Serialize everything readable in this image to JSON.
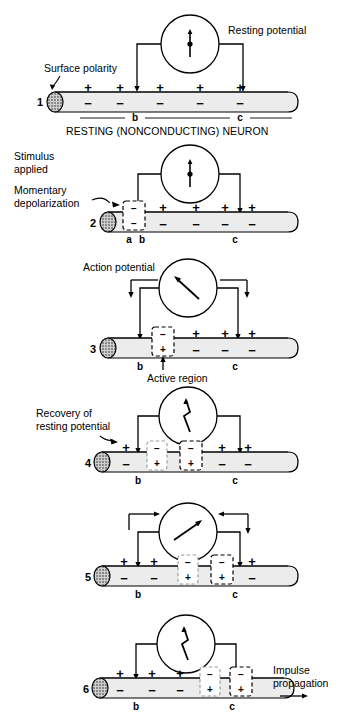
{
  "figure": {
    "title_caption": "RESTING (NONCONDUCTING) NEURON"
  },
  "panels": [
    {
      "number": "1",
      "callouts": [
        {
          "name": "surface-polarity",
          "text": "Surface polarity"
        },
        {
          "name": "resting-potential",
          "text": "Resting potential"
        }
      ],
      "caption": "RESTING (NONCONDUCTING) NEURON",
      "electrode_labels": [
        "b",
        "c"
      ],
      "top_charges": [
        "+",
        "+",
        "+",
        "+",
        "+"
      ],
      "bottom_charges": [
        "−",
        "−",
        "−",
        "−",
        "−"
      ],
      "meter_needle": "vertical",
      "active_boxes": []
    },
    {
      "number": "2",
      "callouts": [
        {
          "name": "stimulus-applied",
          "text": "Stimulus\napplied"
        },
        {
          "name": "momentary-depolarization",
          "text": "Momentary\ndepolarization"
        }
      ],
      "caption": "",
      "electrode_labels": [
        "a",
        "b",
        "c"
      ],
      "top_charges": [
        "+",
        "+",
        "+",
        "+"
      ],
      "bottom_charges": [
        "−",
        "−",
        "−",
        "−"
      ],
      "meter_needle": "vertical",
      "active_boxes": [
        {
          "style": "dashed",
          "top": "−",
          "bottom": "−",
          "state": "depolarizing"
        }
      ]
    },
    {
      "number": "3",
      "callouts": [
        {
          "name": "action-potential",
          "text": "Action potential"
        },
        {
          "name": "active-region",
          "text": "Active region"
        }
      ],
      "caption": "",
      "electrode_labels": [
        "b",
        "c"
      ],
      "top_charges": [
        "+",
        "+",
        "+"
      ],
      "bottom_charges": [
        "−",
        "−",
        "−"
      ],
      "meter_needle": "deflect-left",
      "active_boxes": [
        {
          "style": "dashed",
          "top": "−",
          "bottom": "+",
          "state": "active"
        }
      ]
    },
    {
      "number": "4",
      "callouts": [
        {
          "name": "recovery-of-resting-potential",
          "text": "Recovery of\nresting potential"
        }
      ],
      "caption": "",
      "electrode_labels": [
        "b",
        "c"
      ],
      "top_charges": [
        "+",
        "+",
        "+"
      ],
      "bottom_charges": [
        "−",
        "−",
        "−"
      ],
      "meter_needle": "zigzag",
      "active_boxes": [
        {
          "style": "faded",
          "top": "−",
          "bottom": "+",
          "state": "recovering"
        },
        {
          "style": "dashed",
          "top": "−",
          "bottom": "+",
          "state": "active"
        }
      ]
    },
    {
      "number": "5",
      "callouts": [],
      "caption": "",
      "electrode_labels": [
        "b",
        "c"
      ],
      "top_charges": [
        "+",
        "+",
        "+"
      ],
      "bottom_charges": [
        "−",
        "−",
        "−"
      ],
      "meter_needle": "deflect-right",
      "active_boxes": [
        {
          "style": "faded",
          "top": "−",
          "bottom": "+",
          "state": "recovering"
        },
        {
          "style": "dashed",
          "top": "−",
          "bottom": "+",
          "state": "active"
        }
      ]
    },
    {
      "number": "6",
      "callouts": [
        {
          "name": "impulse-propagation",
          "text": "Impulse\npropagation"
        }
      ],
      "caption": "",
      "electrode_labels": [
        "b",
        "c"
      ],
      "top_charges": [
        "+",
        "+",
        "+"
      ],
      "bottom_charges": [
        "−",
        "−",
        "−"
      ],
      "meter_needle": "zigzag",
      "active_boxes": [
        {
          "style": "faded",
          "top": "−",
          "bottom": "+",
          "state": "recovering"
        },
        {
          "style": "dashed",
          "top": "−",
          "bottom": "+",
          "state": "active"
        }
      ]
    }
  ],
  "text": {
    "p1_surface_polarity": "Surface polarity",
    "p1_resting_potential": "Resting potential",
    "p1_caption": "RESTING (NONCONDUCTING) NEURON",
    "p1_num": "1",
    "p1_b": "b",
    "p1_c": "c",
    "p2_stimulus_1": "Stimulus",
    "p2_stimulus_2": "applied",
    "p2_depol_1": "Momentary",
    "p2_depol_2": "depolarization",
    "p2_num": "2",
    "p2_a": "a",
    "p2_b": "b",
    "p2_c": "c",
    "p3_action_potential": "Action potential",
    "p3_active_region": "Active region",
    "p3_num": "3",
    "p3_b": "b",
    "p3_c": "c",
    "p4_recovery_1": "Recovery of",
    "p4_recovery_2": "resting potential",
    "p4_num": "4",
    "p4_b": "b",
    "p4_c": "c",
    "p5_num": "5",
    "p5_b": "b",
    "p5_c": "c",
    "p6_impulse_1": "Impulse",
    "p6_impulse_2": "propagation",
    "p6_num": "6",
    "p6_b": "b",
    "p6_c": "c",
    "plus": "+",
    "minus": "−"
  },
  "colors": {
    "line": "#000000",
    "axon_fill": "#ececec",
    "axon_fill_light": "#f4f4f4",
    "endcap": "#7a7a7a",
    "background": "#ffffff",
    "faded": "#9a9a9a"
  }
}
